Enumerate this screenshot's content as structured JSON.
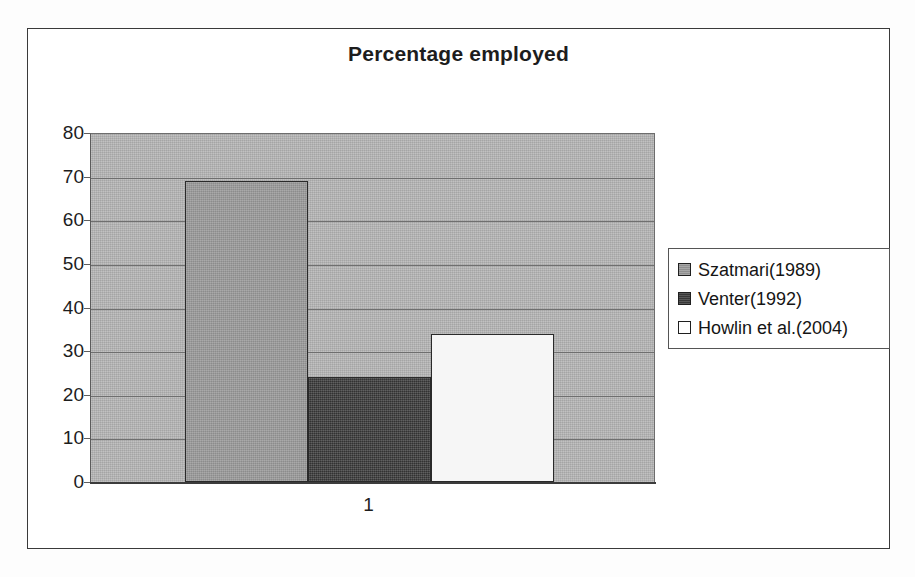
{
  "chart_data": {
    "type": "bar",
    "title": "Percentage employed",
    "xlabel": "",
    "ylabel": "",
    "categories": [
      "1"
    ],
    "series": [
      {
        "name": "Szatmari(1989)",
        "values": [
          69
        ],
        "color": "#9b9b9b"
      },
      {
        "name": "Venter(1992)",
        "values": [
          24
        ],
        "color": "#3d3d3d"
      },
      {
        "name": "Howlin et al.(2004)",
        "values": [
          34
        ],
        "color": "#ffffff"
      }
    ],
    "ylim": [
      0,
      80
    ],
    "ytick_labels": [
      "80",
      "70",
      "60",
      "50",
      "40",
      "30",
      "20",
      "10",
      "0"
    ],
    "ytick_values": [
      80,
      70,
      60,
      50,
      40,
      30,
      20,
      10,
      0
    ],
    "grid": true,
    "legend_position": "right",
    "plot_background_color": "#b3b3b3",
    "frame_color": "#3a3a3a"
  },
  "legend": {
    "entries": [
      {
        "label": "Szatmari(1989)"
      },
      {
        "label": "Venter(1992)"
      },
      {
        "label": "Howlin et al.(2004)"
      }
    ]
  }
}
